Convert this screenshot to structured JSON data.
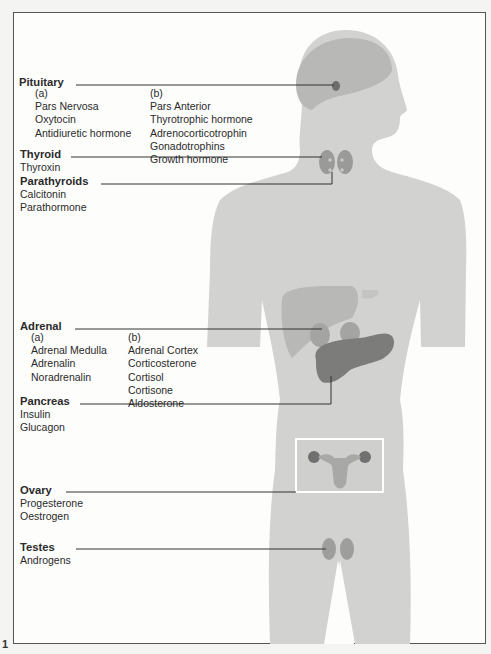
{
  "figure_number": "1",
  "colors": {
    "body": "#d2d2d0",
    "organ_light": "#b8b8b6",
    "organ_mid": "#a4a4a2",
    "organ_dark": "#7c7c7a",
    "leader_line": "#333333"
  },
  "glands": [
    {
      "id": "pituitary",
      "name": "Pituitary",
      "column_a": {
        "label": "(a)",
        "items": [
          "Pars Nervosa",
          "Oxytocin",
          "Antidiuretic hormone"
        ]
      },
      "column_b": {
        "label": "(b)",
        "items": [
          "Pars Anterior",
          "Thyrotrophic hormone",
          "Adrenocorticotrophin",
          "Gonadotrophins",
          "Growth hormone"
        ]
      }
    },
    {
      "id": "thyroid",
      "name": "Thyroid",
      "items": [
        "Thyroxin"
      ]
    },
    {
      "id": "parathyroids",
      "name": "Parathyroids",
      "items": [
        "Calcitonin",
        "Parathormone"
      ]
    },
    {
      "id": "adrenal",
      "name": "Adrenal",
      "column_a": {
        "label": "(a)",
        "items": [
          "Adrenal Medulla",
          "Adrenalin",
          "Noradrenalin"
        ]
      },
      "column_b": {
        "label": "(b)",
        "items": [
          "Adrenal Cortex",
          "Corticosterone",
          "Cortisol",
          "Cortisone",
          "Aldosterone"
        ]
      }
    },
    {
      "id": "pancreas",
      "name": "Pancreas",
      "items": [
        "Insulin",
        "Glucagon"
      ]
    },
    {
      "id": "ovary",
      "name": "Ovary",
      "items": [
        "Progesterone",
        "Oestrogen"
      ]
    },
    {
      "id": "testes",
      "name": "Testes",
      "items": [
        "Androgens"
      ]
    }
  ]
}
